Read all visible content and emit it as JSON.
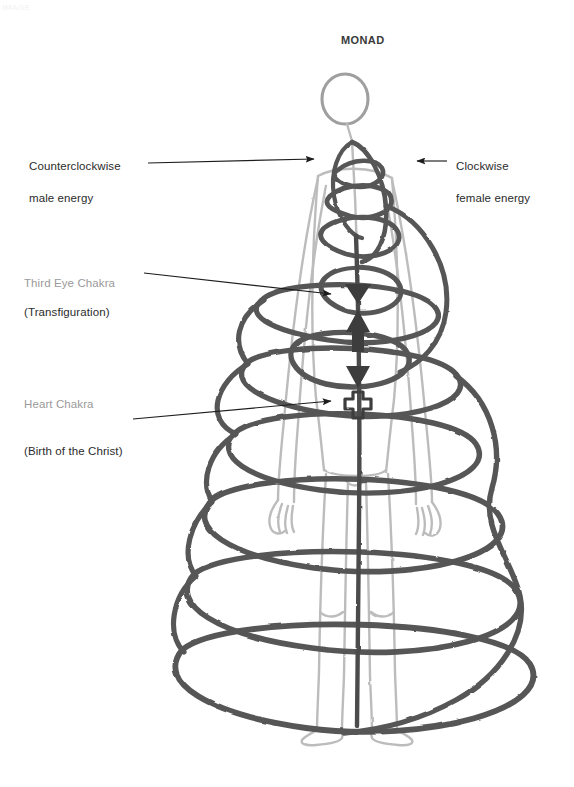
{
  "page": {
    "width": 574,
    "height": 787,
    "background": "#ffffff",
    "scan_artifact_text": "IMAGE"
  },
  "title": {
    "text": "MONAD"
  },
  "labels": {
    "counterclockwise": {
      "line1": "Counterclockwise",
      "line2": "male energy",
      "color": "#2b2b2b"
    },
    "clockwise": {
      "line1": "Clockwise",
      "line2": "female energy",
      "color": "#2b2b2b"
    },
    "third_eye": {
      "line1": "Third Eye Chakra",
      "line2": "(Transfiguration)",
      "line1_color": "#9a9a9a",
      "line2_color": "#2b2b2b"
    },
    "heart": {
      "line1": "Heart Chakra",
      "line2": "(Birth of the Christ)",
      "line1_color": "#9a9a9a",
      "line2_color": "#2b2b2b"
    }
  },
  "colors": {
    "ink_dark": "#4a4a4a",
    "ink_spiral": "#5e5e5e",
    "ink_figure": "#b9b9b9",
    "ink_head": "#9c9c9c",
    "arrow": "#1d1d1d",
    "paper": "#ffffff"
  },
  "figure": {
    "head_center_x": 345,
    "head_center_y": 99,
    "head_radius": 22,
    "axis_x": 358,
    "feet_y": 737
  },
  "spiral": {
    "description": "dark grey hand-drawn helix coiling from narrow at top to wide at bottom around the figure",
    "turns": 9,
    "top_y": 140,
    "bottom_y": 712,
    "min_half_width": 16,
    "max_half_width": 172
  },
  "chakra_symbols": {
    "third_eye": {
      "glyph": "triangle-down",
      "x": 358,
      "y": 296
    },
    "throat": {
      "glyph": "triangle-up",
      "x": 358,
      "y": 328
    },
    "solar": {
      "glyph": "triangle-down",
      "x": 358,
      "y": 378
    },
    "heart": {
      "glyph": "cross",
      "x": 358,
      "y": 404
    }
  },
  "arrows": [
    {
      "name": "counterclockwise-arrow",
      "from_x": 148,
      "from_y": 163,
      "to_x": 315,
      "to_y": 160,
      "direction": "right"
    },
    {
      "name": "clockwise-arrow",
      "from_x": 446,
      "from_y": 161,
      "to_x": 415,
      "to_y": 161,
      "direction": "left"
    },
    {
      "name": "third-eye-arrow",
      "from_x": 143,
      "top_y": 274,
      "to_x": 330,
      "to_y": 294,
      "direction": "right-down"
    },
    {
      "name": "heart-arrow",
      "from_x": 133,
      "from_y": 420,
      "to_x": 330,
      "to_y": 402,
      "direction": "right-up"
    }
  ]
}
